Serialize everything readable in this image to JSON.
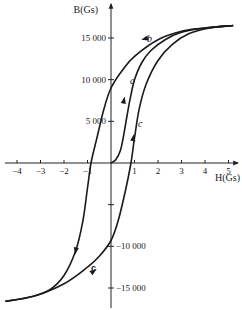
{
  "chart_data": {
    "type": "line",
    "title": "",
    "xlabel": "H(Gs)",
    "ylabel": "B(Gs)",
    "xlim": [
      -4.5,
      5.3
    ],
    "ylim": [
      -17000,
      18500
    ],
    "grid": false,
    "x_ticks": [
      -4,
      -3,
      -2,
      -1,
      1,
      2,
      3,
      4,
      5
    ],
    "x_tick_labels": [
      "-4",
      "-3",
      "-2",
      "-1",
      "1",
      "2",
      "3",
      "4",
      "5"
    ],
    "y_ticks": [
      15000,
      10000,
      5000,
      -5000,
      -10000,
      -15000
    ],
    "y_tick_labels": [
      "15 000",
      "10 000",
      "5 000",
      "",
      "-10 000",
      "-15 000"
    ],
    "series": [
      {
        "name": "a",
        "description": "initial magnetization curve",
        "x": [
          0,
          0.2,
          0.4,
          0.55,
          0.7,
          0.85,
          1.0,
          1.3,
          1.7,
          2.3,
          3.0,
          4.0,
          5.2
        ],
        "y": [
          0,
          400,
          1500,
          3500,
          6000,
          8200,
          10000,
          12000,
          13500,
          14800,
          15700,
          16200,
          16500
        ]
      },
      {
        "name": "b",
        "description": "descending branch",
        "x": [
          5.2,
          4.0,
          3.0,
          2.0,
          1.0,
          0.5,
          0,
          -0.3,
          -0.6,
          -0.85,
          -1.0,
          -1.2,
          -1.5,
          -2.0,
          -2.6,
          -3.3,
          -4.5
        ],
        "y": [
          16500,
          16200,
          15800,
          14800,
          12800,
          11200,
          9000,
          6500,
          3000,
          0,
          -3000,
          -7000,
          -10500,
          -13500,
          -15200,
          -16000,
          -16600
        ]
      },
      {
        "name": "c",
        "description": "ascending branch",
        "x": [
          -4.5,
          -3.3,
          -2.0,
          -1.0,
          -0.5,
          0,
          0.3,
          0.6,
          0.85,
          1.0,
          1.2,
          1.5,
          2.0,
          2.6,
          3.3,
          4.2,
          5.2
        ],
        "y": [
          -16600,
          -16000,
          -14500,
          -12500,
          -11200,
          -9300,
          -7000,
          -3500,
          0,
          3000,
          6500,
          9500,
          12300,
          14200,
          15500,
          16200,
          16500
        ]
      }
    ],
    "annotations": [
      {
        "text": "a",
        "x": 0.7,
        "y": 9500
      },
      {
        "text": "b",
        "x": 1.6,
        "y": 15000
      },
      {
        "text": "c",
        "x": 1.1,
        "y": 4500
      },
      {
        "text": "c",
        "x": -0.55,
        "y": -13800
      }
    ]
  }
}
